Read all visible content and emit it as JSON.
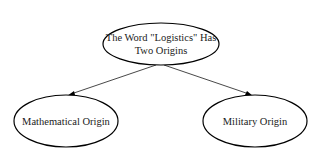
{
  "diagram": {
    "type": "tree",
    "root": {
      "id": "root",
      "line1": "The Word \"Logistics\" Has",
      "line2": "Two Origins"
    },
    "children": [
      {
        "id": "math",
        "label": "Mathematical Origin"
      },
      {
        "id": "military",
        "label": "Military Origin"
      }
    ],
    "edges": [
      {
        "from": "root",
        "to": "math"
      },
      {
        "from": "root",
        "to": "military"
      }
    ]
  }
}
